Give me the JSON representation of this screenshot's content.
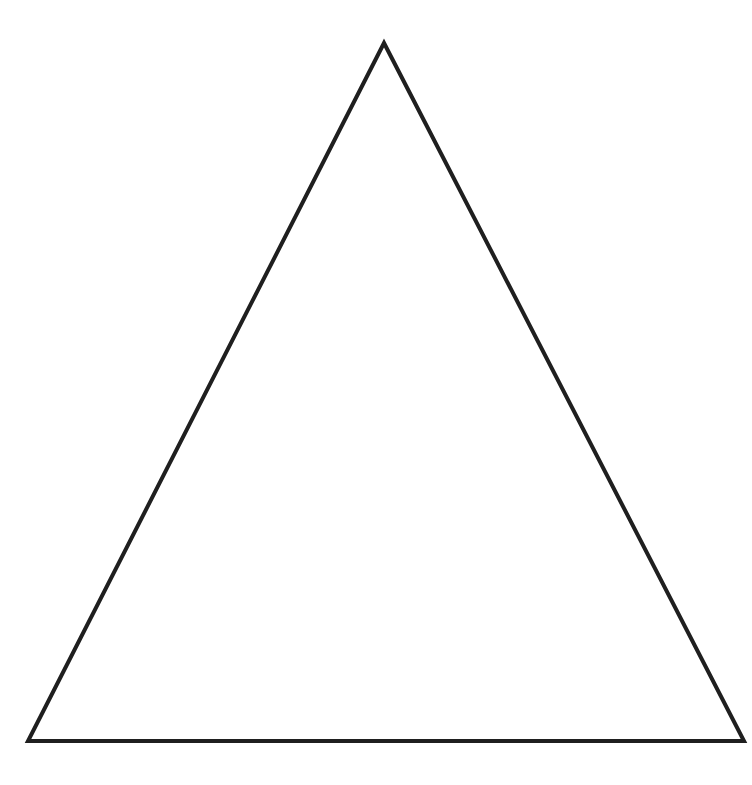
{
  "diagram": {
    "shape": "triangle",
    "kind": "equilateral-outline",
    "stroke_color": "#1f1f1f",
    "fill_color": "#ffffff",
    "stroke_width": 4,
    "vertices": [
      {
        "name": "apex",
        "x": 384,
        "y": 43
      },
      {
        "name": "bottom-left",
        "x": 28,
        "y": 741
      },
      {
        "name": "bottom-right",
        "x": 744,
        "y": 741
      }
    ]
  }
}
